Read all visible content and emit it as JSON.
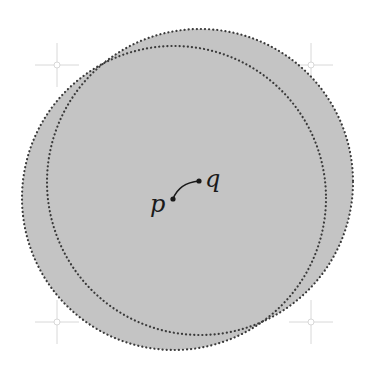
{
  "diagram": {
    "fill_color": "#c4c4c4",
    "boundary_color": "#3a3a3a",
    "guide_color": "#d8d8d8",
    "disks": [
      {
        "name": "disk-centered-p",
        "cx": 174,
        "cy": 198,
        "r": 152
      },
      {
        "name": "disk-centered-q",
        "cx": 200,
        "cy": 182,
        "r": 153
      }
    ],
    "points": [
      {
        "label": "p",
        "x": 173,
        "y": 199,
        "label_x": 150,
        "label_y": 212
      },
      {
        "label": "q",
        "x": 199,
        "y": 181,
        "label_x": 205,
        "label_y": 187
      }
    ],
    "crosshairs": [
      {
        "x": 57,
        "y": 65
      },
      {
        "x": 311,
        "y": 65
      },
      {
        "x": 57,
        "y": 322
      },
      {
        "x": 311,
        "y": 322
      }
    ]
  }
}
